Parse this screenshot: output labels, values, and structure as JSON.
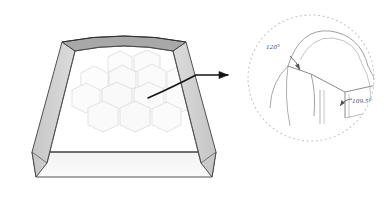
{
  "figure": {
    "background_color": "#ffffff"
  },
  "tray": {
    "name": "shallow transparent tray",
    "top_wall_color": "#a8a8a8",
    "side_wall_color": "#cecece",
    "front_wall_color": "#f4f4f4",
    "outline_color": "#3c3c3c"
  },
  "bubble_raft": {
    "name": "hexagonal bubble array",
    "cell_count": 13,
    "cell_outline_color": "#e6e6e6",
    "cell_fill_color": "#fbfbfb",
    "arrangement": "hexagonal close packing"
  },
  "pointer": {
    "name": "curved arrow from raft to inset",
    "color": "#1a1a1a"
  },
  "inset": {
    "name": "magnified detail circle",
    "border_color": "#c9c9c9",
    "border_style": "dashed",
    "line_color": "#8c8c8c",
    "annotations": [
      {
        "id": "plateau-angle-120",
        "label": "120°",
        "description": "angle between soap films meeting at an edge"
      },
      {
        "id": "plateau-angle-109",
        "label": "109.5°",
        "description": "tetrahedral angle between Plateau borders meeting at a vertex"
      }
    ]
  }
}
